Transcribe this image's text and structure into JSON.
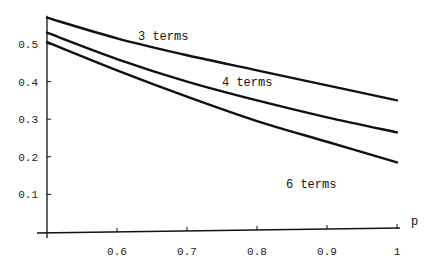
{
  "chart_data": {
    "type": "line",
    "title": "",
    "xlabel": "p",
    "ylabel": "",
    "xlim": [
      0.5,
      1.0
    ],
    "ylim": [
      0,
      0.57
    ],
    "x_ticks": [
      "0.6",
      "0.7",
      "0.8",
      "0.9",
      "1"
    ],
    "y_ticks": [
      "0.1",
      "0.2",
      "0.3",
      "0.4",
      "0.5"
    ],
    "grid": false,
    "legend": "inline labels",
    "x": [
      0.5,
      0.6,
      0.7,
      0.8,
      0.9,
      1.0
    ],
    "series": [
      {
        "name": "3 terms",
        "values": [
          0.57,
          0.515,
          0.47,
          0.43,
          0.39,
          0.35
        ]
      },
      {
        "name": "4 terms",
        "values": [
          0.53,
          0.46,
          0.4,
          0.35,
          0.305,
          0.265
        ]
      },
      {
        "name": "6 terms",
        "values": [
          0.505,
          0.43,
          0.36,
          0.295,
          0.24,
          0.185
        ]
      }
    ],
    "annotations": [
      "3 terms",
      "4 terms",
      "6 terms"
    ]
  }
}
